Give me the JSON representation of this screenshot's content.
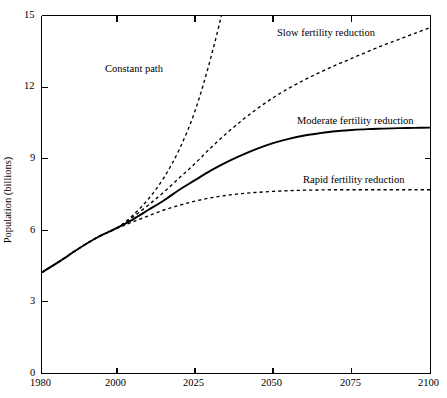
{
  "chart_data": {
    "type": "line",
    "title": "",
    "subtitle": "",
    "xlabel": "",
    "ylabel": "Population (billions)",
    "xlim": [
      1980,
      2100
    ],
    "ylim": [
      0,
      15
    ],
    "grid": false,
    "legend_position": "inline-annotations",
    "xticks": [
      1980,
      2000,
      2025,
      2050,
      2075,
      2100
    ],
    "xtick_labels": [
      "1980",
      "2000",
      "2025",
      "2050",
      "2075",
      "2100"
    ],
    "yticks": [
      0,
      3,
      6,
      9,
      12,
      15
    ],
    "ytick_labels": [
      "0",
      "3",
      "6",
      "9",
      "12",
      "15"
    ],
    "x": [
      1980,
      1985,
      1990,
      1995,
      2000,
      2005,
      2010,
      2015,
      2020,
      2025,
      2030,
      2035,
      2040,
      2045,
      2050,
      2055,
      2060,
      2065,
      2070,
      2075,
      2080,
      2085,
      2090,
      2095,
      2100
    ],
    "series": [
      {
        "name": "Constant path",
        "style": "dashed",
        "annotation": "Constant path",
        "values": [
          4.23,
          4.72,
          5.25,
          5.72,
          6.1,
          6.62,
          7.3,
          8.2,
          9.4,
          11.0,
          13.2,
          15.9,
          19.3,
          23.5,
          28.7,
          35.1,
          43.0,
          52.7,
          64.6,
          79.2,
          97.0,
          118.9,
          145.7,
          178.5,
          218.7
        ],
        "clipped_at_top": true,
        "exits_top_near_year": 2030
      },
      {
        "name": "Slow fertility reduction",
        "style": "dashed",
        "annotation": "Slow fertility reduction",
        "values": [
          4.23,
          4.72,
          5.25,
          5.72,
          6.1,
          6.55,
          7.05,
          7.6,
          8.2,
          8.8,
          9.45,
          10.05,
          10.6,
          11.1,
          11.55,
          11.95,
          12.3,
          12.62,
          12.92,
          13.2,
          13.48,
          13.75,
          14.0,
          14.25,
          14.5
        ],
        "value_at_2100": 14.5
      },
      {
        "name": "Moderate fertility reduction",
        "style": "solid",
        "annotation": "Moderate fertility reduction",
        "values": [
          4.23,
          4.72,
          5.25,
          5.72,
          6.1,
          6.45,
          6.85,
          7.25,
          7.7,
          8.1,
          8.5,
          8.85,
          9.15,
          9.42,
          9.65,
          9.83,
          9.97,
          10.07,
          10.15,
          10.2,
          10.24,
          10.26,
          10.28,
          10.29,
          10.3
        ],
        "value_at_2100": 10.3
      },
      {
        "name": "Rapid fertility reduction",
        "style": "dashed",
        "annotation": "Rapid fertility reduction",
        "values": [
          4.23,
          4.72,
          5.25,
          5.72,
          6.08,
          6.35,
          6.6,
          6.85,
          7.05,
          7.22,
          7.36,
          7.46,
          7.54,
          7.59,
          7.63,
          7.66,
          7.68,
          7.69,
          7.7,
          7.7,
          7.7,
          7.7,
          7.7,
          7.7,
          7.7
        ],
        "value_at_2100": 7.7
      }
    ],
    "colors": {
      "line": "#000000",
      "axis": "#000000",
      "background": "#ffffff"
    }
  },
  "annotations": {
    "constant_path": "Constant path",
    "slow": "Slow fertility reduction",
    "moderate": "Moderate fertility reduction",
    "rapid": "Rapid fertility reduction"
  },
  "axes": {
    "y_title": "Population (billions)",
    "x_tick_1": "1980",
    "x_tick_2": "2000",
    "x_tick_3": "2025",
    "x_tick_4": "2050",
    "x_tick_5": "2075",
    "x_tick_6": "2100",
    "y_tick_0": "0",
    "y_tick_3": "3",
    "y_tick_6": "6",
    "y_tick_9": "9",
    "y_tick_12": "12",
    "y_tick_15": "15"
  }
}
